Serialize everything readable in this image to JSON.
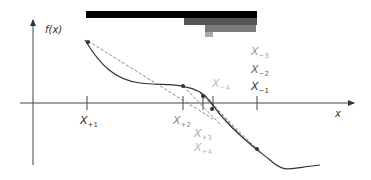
{
  "diagram": {
    "type": "secant-method-illustration",
    "y_axis_label": "f(x)",
    "x_axis_label": "x",
    "colors": {
      "bar1": "#000000",
      "bar2": "#555555",
      "bar3": "#777777",
      "bar4": "#aaaaaa",
      "curve": "#333333",
      "secant": "#555555",
      "axis": "#444444",
      "label_dark": "#333333",
      "label_mid": "#777777",
      "label_light": "#aaaaaa"
    },
    "bars": [
      {
        "x1": 86,
        "x2": 257,
        "y": 11,
        "h": 7,
        "color": "#000000"
      },
      {
        "x1": 184,
        "x2": 257,
        "y": 18,
        "h": 7,
        "color": "#555555"
      },
      {
        "x1": 205,
        "x2": 256,
        "y": 25,
        "h": 7,
        "color": "#777777"
      },
      {
        "x1": 205,
        "x2": 213,
        "y": 32,
        "h": 5,
        "color": "#aaaaaa"
      }
    ],
    "right_labels": [
      {
        "base": "X",
        "sub": "−3",
        "color": "#999999"
      },
      {
        "base": "X",
        "sub": "−2",
        "color": "#666666"
      },
      {
        "base": "X",
        "sub": "−1",
        "color": "#333333"
      }
    ],
    "mid_label": {
      "base": "X",
      "sub": "−4",
      "color": "#bbbbbb"
    },
    "tick_labels": [
      {
        "base": "X",
        "sub": "+1",
        "color": "#333333"
      },
      {
        "base": "X",
        "sub": "+2",
        "color": "#888888"
      },
      {
        "base": "X",
        "sub": "+3",
        "color": "#aaaaaa"
      },
      {
        "base": "X",
        "sub": "+4",
        "color": "#bbbbbb"
      }
    ]
  }
}
